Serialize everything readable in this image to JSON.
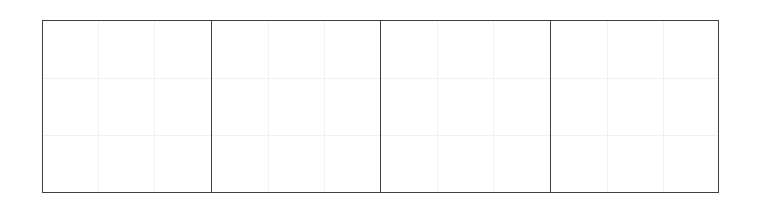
{
  "figure": {
    "background_color": "#ffffff",
    "width_px": 759,
    "height_px": 205,
    "title": "",
    "subtitle": ""
  },
  "panel_frame": {
    "border_color": "#3f3f3f",
    "border_width_px": 1.3,
    "divider_color": "#3f3f3f",
    "left_px": 42,
    "top_px": 20,
    "width_px": 677,
    "height_px": 173
  },
  "grid": {
    "visible": true,
    "color": "#f0f0f0",
    "line_width_px": 1,
    "rows_per_panel": 3,
    "cols_per_panel": 3
  },
  "chart_data": {
    "type": "line",
    "title": "",
    "subtitle": "",
    "xlabel": "",
    "ylabel": "",
    "layout": "faceted small-multiples, 1 row x 4 columns",
    "facet_count": 4,
    "panel_background": "#ffffff",
    "panel_border_color": "#3f3f3f",
    "grid": true,
    "grid_color": "#f0f0f0",
    "grid_rows": 3,
    "grid_cols": 3,
    "legend": null,
    "legend_position": "none",
    "xticklabels": [],
    "yticklabels": [],
    "xlim": [
      0,
      3
    ],
    "ylim": [
      0,
      3
    ],
    "annotations": [],
    "series": [],
    "facets": [
      {
        "index": 0,
        "label": "",
        "left_px": 42,
        "right_px": 210,
        "series": [],
        "values": []
      },
      {
        "index": 1,
        "label": "",
        "left_px": 210,
        "right_px": 380,
        "series": [],
        "values": []
      },
      {
        "index": 2,
        "label": "",
        "left_px": 380,
        "right_px": 550,
        "series": [],
        "values": []
      },
      {
        "index": 3,
        "label": "",
        "left_px": 550,
        "right_px": 719,
        "series": [],
        "values": []
      }
    ],
    "note": "All four panels are empty: no plotted marks, tick labels, axis titles, legend or annotations are rendered in the image."
  }
}
